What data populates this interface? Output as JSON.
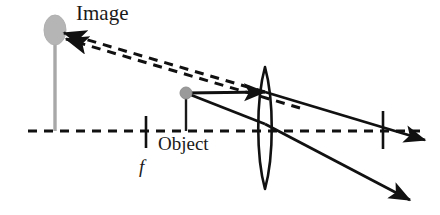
{
  "figure": {
    "kind": "ray-optics-diagram",
    "background_color": "#ffffff",
    "width": 440,
    "height": 215
  },
  "labels": {
    "image": "Image",
    "object": "Object",
    "focal_length": "f"
  },
  "colors": {
    "ink": "#1a1a1a",
    "ray_solid": "#111111",
    "ray_dashed": "#111111",
    "axis": "#111111",
    "object_dot": "#9a9a9a",
    "object_stem": "#1a1a1a",
    "image_blob": "#b5b5b5",
    "image_stem": "#a8a8a8",
    "lens_outline": "#111111"
  },
  "geometry": {
    "optical_axis": {
      "x1": 28,
      "y1": 131,
      "x2": 420,
      "y2": 131,
      "dash": "9 7",
      "width": 3
    },
    "lens": {
      "center_x": 265,
      "top_y": 67,
      "bottom_y": 189,
      "half_width": 9,
      "width": 2.6
    },
    "focal_point_left": {
      "x": 146,
      "y_top": 116,
      "y_bottom": 148
    },
    "focal_point_right": {
      "x": 383,
      "y_top": 111,
      "y_bottom": 149
    },
    "object": {
      "x": 186,
      "y": 93,
      "dot_r": 6,
      "stem_bottom_y": 131
    },
    "image": {
      "x": 55,
      "y": 30,
      "blob_rx": 11,
      "blob_ry": 15,
      "stem_bottom_y": 131
    }
  },
  "rays": [
    {
      "name": "parallel-ray-incident",
      "style": "solid",
      "points": [
        [
          186,
          93
        ],
        [
          265,
          92
        ]
      ],
      "arrowhead_at_end": true
    },
    {
      "name": "parallel-ray-refracted",
      "style": "solid",
      "points": [
        [
          265,
          92
        ],
        [
          425,
          140
        ]
      ],
      "arrowhead_at_end": true
    },
    {
      "name": "center-ray-incident",
      "style": "solid",
      "points": [
        [
          186,
          93
        ],
        [
          265,
          124
        ]
      ],
      "arrowhead_at_end": false
    },
    {
      "name": "center-ray-refracted",
      "style": "solid",
      "points": [
        [
          265,
          124
        ],
        [
          410,
          200
        ]
      ],
      "arrowhead_at_end": true
    },
    {
      "name": "virtual-ray-upper",
      "style": "dashed",
      "points": [
        [
          265,
          92
        ],
        [
          64,
          33
        ]
      ],
      "arrowhead_at_end": true
    },
    {
      "name": "virtual-ray-lower",
      "style": "dashed",
      "points": [
        [
          300,
          108
        ],
        [
          66,
          39
        ]
      ],
      "arrowhead_at_end": true
    }
  ]
}
